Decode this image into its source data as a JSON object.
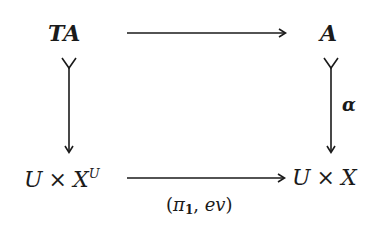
{
  "diagram": {
    "type": "commutative-square",
    "nodes": {
      "top_left": {
        "main": "TA"
      },
      "top_right": {
        "main": "A"
      },
      "bottom_left": {
        "left": "U",
        "op": "×",
        "right": "X",
        "superscript": "U"
      },
      "bottom_right": {
        "left": "U",
        "op": "×",
        "right": "X"
      }
    },
    "arrows": {
      "top": {
        "from": "TA",
        "to": "A",
        "label": "",
        "style": "plain"
      },
      "left": {
        "from": "TA",
        "to": "U × X^U",
        "label": "",
        "style": "monic (tail fork)"
      },
      "right": {
        "from": "A",
        "to": "U × X",
        "label": "α",
        "style": "monic (tail fork)"
      },
      "bottom": {
        "from": "U × X^U",
        "to": "U × X",
        "label_open": "(",
        "label_pi": "π",
        "label_sub": "1",
        "label_rest": ", ",
        "label_ev": "ev",
        "label_close": ")",
        "style": "plain"
      }
    },
    "colors": {
      "ink": "#1a1a1a",
      "background": "#ffffff"
    }
  }
}
